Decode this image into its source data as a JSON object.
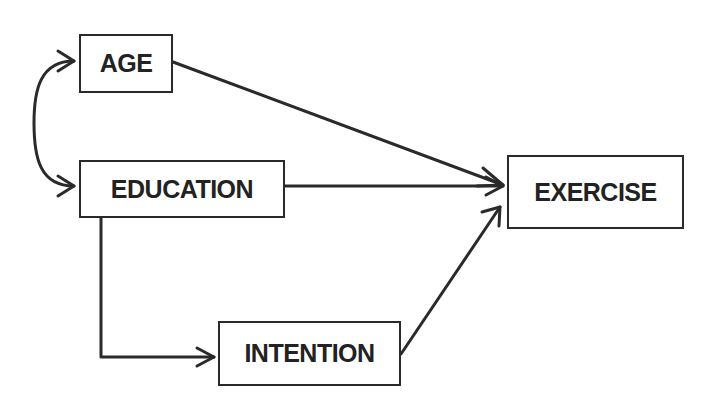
{
  "diagram": {
    "type": "path-diagram",
    "nodes": {
      "age": {
        "label": "AGE"
      },
      "education": {
        "label": "EDUCATION"
      },
      "intention": {
        "label": "INTENTION"
      },
      "exercise": {
        "label": "EXERCISE"
      }
    },
    "edges": [
      {
        "from": "age",
        "to": "education",
        "kind": "bidirectional-curved"
      },
      {
        "from": "age",
        "to": "exercise",
        "kind": "directed"
      },
      {
        "from": "education",
        "to": "exercise",
        "kind": "directed"
      },
      {
        "from": "education",
        "to": "intention",
        "kind": "directed-elbow"
      },
      {
        "from": "intention",
        "to": "exercise",
        "kind": "directed"
      }
    ],
    "colors": {
      "stroke": "#2a2a2a",
      "background": "#ffffff",
      "text": "#222222"
    }
  }
}
